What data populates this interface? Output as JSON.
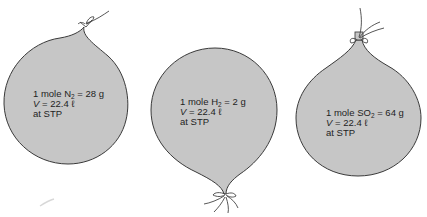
{
  "colors": {
    "balloon_fill": "#c6c6c6",
    "balloon_outline": "#3a3a3a",
    "string": "#444444",
    "background": "#ffffff",
    "text": "#1e1e1e"
  },
  "balloons": [
    {
      "gas": "N2",
      "gas_symbol": "N",
      "gas_subscript": "2",
      "line1_prefix": "1 mole ",
      "line1_suffix": " = 28 g",
      "mass": "28 g",
      "volume_var": "V",
      "volume_value": " = 22.4 ℓ",
      "conditions": "at STP",
      "knot_position": "top"
    },
    {
      "gas": "H2",
      "gas_symbol": "H",
      "gas_subscript": "2",
      "line1_prefix": "1 mole ",
      "line1_suffix": " = 2 g",
      "mass": "2 g",
      "volume_var": "V",
      "volume_value": " = 22.4 ℓ",
      "conditions": "at STP",
      "knot_position": "bottom"
    },
    {
      "gas": "SO2",
      "gas_symbol": "SO",
      "gas_subscript": "2",
      "line1_prefix": "1 mole ",
      "line1_suffix": " = 64 g",
      "mass": "64 g",
      "volume_var": "V",
      "volume_value": " = 22.4 ℓ",
      "conditions": "at STP",
      "knot_position": "top"
    }
  ]
}
